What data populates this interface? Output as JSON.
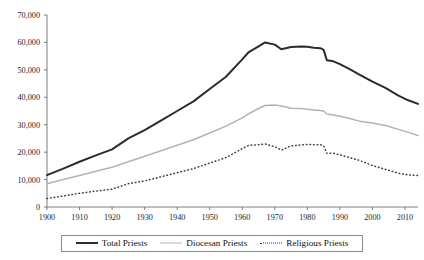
{
  "chart_data": {
    "type": "line",
    "title": "",
    "subtitle": "",
    "xlabel": "",
    "ylabel": "",
    "xlim": [
      1900,
      2014
    ],
    "ylim": [
      0,
      70000
    ],
    "grid": false,
    "legend_position": "bottom",
    "x_ticks": [
      1900,
      1910,
      1920,
      1930,
      1940,
      1950,
      1960,
      1970,
      1980,
      1990,
      2000,
      2010
    ],
    "x_tick_labels": [
      "1900",
      "1910",
      "1920",
      "1930",
      "1940",
      "1950",
      "1960",
      "1970",
      "1980",
      "1990",
      "2000",
      "2010"
    ],
    "y_ticks": [
      0,
      10000,
      20000,
      30000,
      40000,
      50000,
      60000,
      70000
    ],
    "y_tick_labels": [
      "0",
      "10,000",
      "20,000",
      "30,000",
      "40,000",
      "50,000",
      "60,000",
      "70,000"
    ],
    "x": [
      1900,
      1905,
      1910,
      1915,
      1920,
      1925,
      1930,
      1935,
      1940,
      1945,
      1950,
      1955,
      1960,
      1962,
      1965,
      1967,
      1970,
      1972,
      1975,
      1978,
      1980,
      1982,
      1984,
      1985,
      1986,
      1988,
      1990,
      1993,
      1996,
      2000,
      2004,
      2008,
      2011,
      2014
    ],
    "series": [
      {
        "name": "Total Priests",
        "color": "#2b2b2b",
        "style": "solid-thick",
        "values": [
          11600,
          14000,
          16500,
          18800,
          21000,
          25000,
          28000,
          31500,
          35000,
          38500,
          43000,
          47500,
          53800,
          56500,
          58600,
          60000,
          59200,
          57500,
          58300,
          58500,
          58400,
          58100,
          57900,
          57300,
          53500,
          53100,
          52100,
          50300,
          48300,
          45700,
          43400,
          40600,
          38900,
          37600
        ]
      },
      {
        "name": "Diocesan Priests",
        "color": "#b3b3b3",
        "style": "solid-thin",
        "values": [
          8500,
          10000,
          11500,
          13000,
          14500,
          16500,
          18500,
          20500,
          22500,
          24500,
          27000,
          29500,
          32500,
          34000,
          35900,
          37000,
          37200,
          36800,
          36000,
          35900,
          35600,
          35400,
          35200,
          35000,
          33900,
          33500,
          33100,
          32300,
          31300,
          30600,
          29700,
          28300,
          27200,
          26100
        ]
      },
      {
        "name": "Religious Priests",
        "color": "#3a3a3a",
        "style": "dotted",
        "values": [
          3100,
          4000,
          5000,
          5800,
          6500,
          8500,
          9500,
          11000,
          12500,
          14000,
          16000,
          18000,
          21300,
          22500,
          22700,
          23000,
          22000,
          20700,
          22300,
          22600,
          22800,
          22700,
          22700,
          22300,
          19600,
          19600,
          19000,
          18000,
          17000,
          15100,
          13700,
          12300,
          11700,
          11500
        ]
      }
    ],
    "legend": [
      {
        "label": "Total Priests",
        "swatch": "solid-thick-black"
      },
      {
        "label": "Diocesan Priests",
        "swatch": "solid-thin-gray"
      },
      {
        "label": "Religious Priests",
        "swatch": "dotted-black"
      }
    ],
    "colors": {
      "total": "#2b2b2b",
      "diocesan": "#b3b3b3",
      "religious": "#3a3a3a",
      "axis": "#6f6f6f",
      "background": "#ffffff"
    }
  }
}
